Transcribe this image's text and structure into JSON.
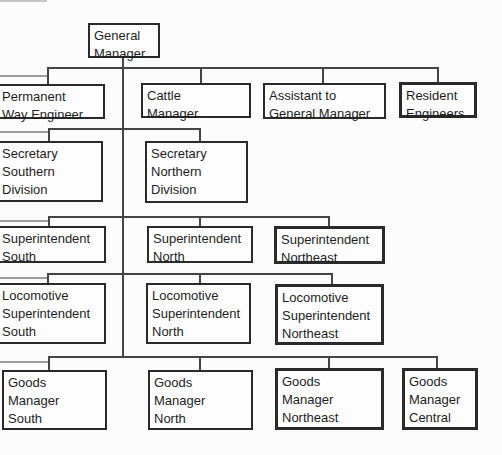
{
  "diagram": {
    "type": "org-chart",
    "root": "general-manager",
    "children_of_general_manager": [
      "permanent-way-engineer",
      "cattle-manager",
      "assistant-to-general-manager",
      "resident-engineers",
      "secretary-southern-division",
      "secretary-northern-division",
      "superintendent-south",
      "superintendent-north",
      "superintendent-northeast",
      "locomotive-superintendent-south",
      "locomotive-superintendent-north",
      "locomotive-superintendent-northeast",
      "goods-manager-south",
      "goods-manager-north",
      "goods-manager-northeast",
      "goods-manager-central"
    ],
    "nodes": [
      {
        "id": "general-manager",
        "label": "General\nManager"
      },
      {
        "id": "permanent-way-engineer",
        "label": "Permanent\nWay Engineer"
      },
      {
        "id": "cattle-manager",
        "label": "Cattle\nManager"
      },
      {
        "id": "assistant-to-general-manager",
        "label": "Assistant to\nGeneral Manager"
      },
      {
        "id": "resident-engineers",
        "label": "Resident\nEngineers"
      },
      {
        "id": "secretary-southern-division",
        "label": "Secretary\nSouthern\nDivision"
      },
      {
        "id": "secretary-northern-division",
        "label": "Secretary\nNorthern\nDivision"
      },
      {
        "id": "superintendent-south",
        "label": "Superintendent\nSouth"
      },
      {
        "id": "superintendent-north",
        "label": "Superintendent\nNorth"
      },
      {
        "id": "superintendent-northeast",
        "label": "Superintendent\nNortheast"
      },
      {
        "id": "locomotive-superintendent-south",
        "label": "Locomotive\nSuperintendent\nSouth"
      },
      {
        "id": "locomotive-superintendent-north",
        "label": "Locomotive\nSuperintendent\nNorth"
      },
      {
        "id": "locomotive-superintendent-northeast",
        "label": "Locomotive\nSuperintendent\nNortheast"
      },
      {
        "id": "goods-manager-south",
        "label": "Goods\nManager\nSouth"
      },
      {
        "id": "goods-manager-north",
        "label": "Goods\nManager\nNorth"
      },
      {
        "id": "goods-manager-northeast",
        "label": "Goods\nManager\nNortheast"
      },
      {
        "id": "goods-manager-central",
        "label": "Goods\nManager\nCentral"
      }
    ],
    "colors": {
      "line": "#454545",
      "box_border": "#2a2a2a",
      "text": "#1d1d1d",
      "background": "#fcfcfc"
    }
  }
}
